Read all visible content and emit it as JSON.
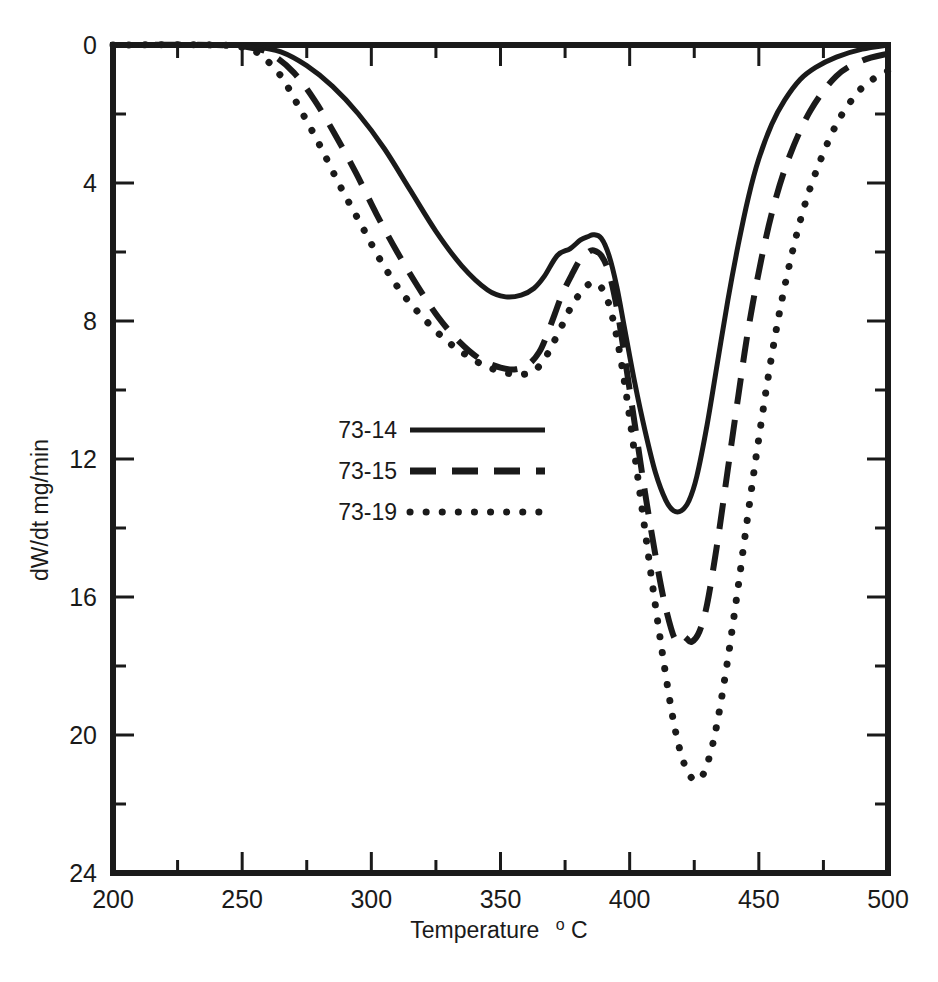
{
  "chart_data": {
    "type": "line",
    "title": "",
    "xlabel": "Temperature °C",
    "xlabel_main": "Temperature",
    "xlabel_sup": "o",
    "xlabel_unit": "C",
    "ylabel": "dW/dt mg/min",
    "xlim": [
      200,
      500
    ],
    "ylim": [
      0,
      24
    ],
    "y_inverted": true,
    "grid": false,
    "legend_position": "center-left",
    "xticks": [
      200,
      250,
      300,
      350,
      400,
      450,
      500
    ],
    "xtick_labels": [
      "200",
      "250",
      "300",
      "350",
      "400",
      "450",
      "500"
    ],
    "x_minor_ticks": [
      225,
      275,
      325,
      375,
      425,
      475
    ],
    "yticks": [
      0,
      4,
      8,
      12,
      16,
      20,
      24
    ],
    "ytick_labels": [
      "0",
      "4",
      "8",
      "12",
      "16",
      "20",
      "24"
    ],
    "y_minor_ticks": [
      2,
      6,
      10,
      14,
      18,
      22
    ],
    "series": [
      {
        "name": "73-14",
        "style": "solid",
        "color": "#1a1a1a",
        "x": [
          200,
          240,
          255,
          265,
          275,
          285,
          295,
          305,
          315,
          325,
          335,
          345,
          352,
          358,
          363,
          367,
          372,
          377,
          381,
          384,
          386,
          389,
          392,
          395,
          398,
          402,
          406,
          410,
          414,
          417,
          420,
          423,
          426,
          430,
          434,
          438,
          442,
          446,
          450,
          455,
          460,
          466,
          472,
          480,
          490,
          500
        ],
        "y": [
          0.0,
          0.0,
          0.05,
          0.2,
          0.6,
          1.2,
          2.0,
          3.0,
          4.2,
          5.4,
          6.4,
          7.1,
          7.3,
          7.25,
          7.05,
          6.7,
          6.1,
          5.9,
          5.65,
          5.55,
          5.5,
          5.6,
          6.1,
          7.0,
          8.2,
          9.8,
          11.2,
          12.4,
          13.2,
          13.5,
          13.5,
          13.2,
          12.5,
          11.0,
          9.2,
          7.4,
          5.8,
          4.4,
          3.3,
          2.3,
          1.6,
          1.0,
          0.65,
          0.35,
          0.12,
          0.0
        ]
      },
      {
        "name": "73-15",
        "style": "dashed",
        "color": "#1a1a1a",
        "x": [
          200,
          240,
          255,
          262,
          270,
          278,
          286,
          294,
          302,
          310,
          318,
          326,
          334,
          342,
          350,
          356,
          361,
          365,
          368,
          371,
          374,
          378,
          381,
          384,
          386,
          389,
          392,
          395,
          398,
          402,
          406,
          410,
          413,
          416,
          418,
          420,
          422,
          424,
          427,
          430,
          434,
          438,
          442,
          446,
          451,
          456,
          462,
          470,
          480,
          490,
          500
        ],
        "y": [
          0.0,
          0.0,
          0.1,
          0.3,
          0.8,
          1.6,
          2.6,
          3.7,
          4.9,
          6.0,
          7.0,
          7.9,
          8.6,
          9.1,
          9.35,
          9.4,
          9.25,
          8.9,
          8.4,
          7.8,
          7.2,
          6.6,
          6.2,
          6.0,
          5.95,
          6.1,
          6.6,
          7.6,
          9.0,
          11.0,
          13.0,
          14.8,
          16.0,
          16.9,
          17.25,
          17.1,
          17.2,
          17.3,
          17.0,
          16.2,
          14.4,
          12.3,
          10.2,
          8.2,
          6.2,
          4.6,
          3.2,
          1.9,
          0.9,
          0.45,
          0.25
        ]
      },
      {
        "name": "73-19",
        "style": "dotted",
        "color": "#1a1a1a",
        "x": [
          200,
          240,
          252,
          258,
          265,
          272,
          280,
          288,
          296,
          304,
          312,
          320,
          328,
          336,
          344,
          352,
          358,
          363,
          367,
          370,
          374,
          378,
          382,
          385,
          388,
          391,
          394,
          397,
          400,
          404,
          408,
          412,
          416,
          419,
          422,
          425,
          428,
          431,
          434,
          438,
          442,
          446,
          450,
          455,
          460,
          466,
          472,
          480,
          488,
          494,
          500
        ],
        "y": [
          0.0,
          0.0,
          0.1,
          0.35,
          0.9,
          1.8,
          2.9,
          4.1,
          5.2,
          6.3,
          7.2,
          7.9,
          8.5,
          8.95,
          9.3,
          9.5,
          9.55,
          9.45,
          9.1,
          8.7,
          8.1,
          7.5,
          7.1,
          6.9,
          6.95,
          7.3,
          8.1,
          9.3,
          10.8,
          13.0,
          15.2,
          17.3,
          19.2,
          20.3,
          21.0,
          21.3,
          21.2,
          20.6,
          19.6,
          17.8,
          15.7,
          13.5,
          11.4,
          9.0,
          7.0,
          5.1,
          3.7,
          2.3,
          1.4,
          1.0,
          0.75
        ]
      }
    ],
    "annotations": []
  },
  "legend": {
    "items": [
      {
        "label": "73-14",
        "style": "solid"
      },
      {
        "label": "73-15",
        "style": "dashed"
      },
      {
        "label": "73-19",
        "style": "dotted"
      }
    ]
  },
  "axes": {
    "x_title_main": "Temperature",
    "x_title_sup": "o",
    "x_title_unit": "C",
    "y_title": "dW/dt mg/min"
  }
}
